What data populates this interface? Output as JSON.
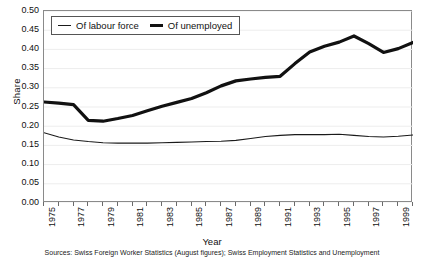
{
  "chart_data": {
    "type": "line",
    "title": "",
    "xlabel": "Year",
    "ylabel": "Share",
    "xlim": [
      1975,
      2000
    ],
    "ylim": [
      0.0,
      0.5
    ],
    "grid": "horizontal-faint",
    "legend_position": "top-left-inside",
    "ytick_labels": [
      "0.50",
      "0.45",
      "0.40",
      "0.35",
      "0.30",
      "0.25",
      "0.20",
      "0.15",
      "0.10",
      "0.05",
      "0.00"
    ],
    "ytick_values": [
      0.5,
      0.45,
      0.4,
      0.35,
      0.3,
      0.25,
      0.2,
      0.15,
      0.1,
      0.05,
      0.0
    ],
    "xtick_labels": [
      "1975",
      "1977",
      "1979",
      "1981",
      "1983",
      "1985",
      "1987",
      "1989",
      "1991",
      "1993",
      "1995",
      "1997",
      "1999"
    ],
    "xtick_values": [
      1975,
      1977,
      1979,
      1981,
      1983,
      1985,
      1987,
      1989,
      1991,
      1993,
      1995,
      1997,
      1999
    ],
    "x": [
      1975,
      1976,
      1977,
      1978,
      1979,
      1980,
      1981,
      1982,
      1983,
      1984,
      1985,
      1986,
      1987,
      1988,
      1989,
      1990,
      1991,
      1992,
      1993,
      1994,
      1995,
      1996,
      1997,
      1998,
      1999,
      2000
    ],
    "series": [
      {
        "name": "Of labour force",
        "style": "thin",
        "color": "#1a1a1a",
        "values": [
          0.183,
          0.172,
          0.164,
          0.16,
          0.157,
          0.156,
          0.156,
          0.156,
          0.157,
          0.158,
          0.159,
          0.16,
          0.161,
          0.163,
          0.168,
          0.173,
          0.176,
          0.178,
          0.178,
          0.178,
          0.179,
          0.176,
          0.173,
          0.172,
          0.174,
          0.177
        ]
      },
      {
        "name": "Of unemployed",
        "style": "thick",
        "color": "#111111",
        "values": [
          0.263,
          0.26,
          0.256,
          0.215,
          0.213,
          0.22,
          0.228,
          0.24,
          0.252,
          0.262,
          0.272,
          0.287,
          0.305,
          0.318,
          0.323,
          0.327,
          0.33,
          0.363,
          0.393,
          0.408,
          0.419,
          0.435,
          0.415,
          0.392,
          0.402,
          0.418
        ]
      }
    ],
    "series_full": {
      "note": "dense annual/monthly polyline; key inflection points listed in series values"
    },
    "source": "Sources: Swiss Foreign Worker Statistics (August figures); Swiss Employment Statistics and Unemployment"
  },
  "legend": {
    "items": [
      {
        "label": "Of labour force"
      },
      {
        "label": "Of unemployed"
      }
    ]
  }
}
